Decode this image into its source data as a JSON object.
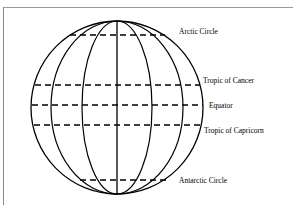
{
  "diagram": {
    "globe": {
      "cx": 117,
      "cy": 107.5,
      "rx": 86,
      "ry": 86.5
    },
    "meridians_rx": [
      0,
      35,
      66
    ],
    "latitude_lines": [
      {
        "name": "Arctic Circle",
        "y": 35,
        "x1": 70,
        "x2": 165,
        "label_x": 179,
        "label_y": 33.5
      },
      {
        "name": "Tropic of Cancer",
        "y": 85,
        "x1": 35,
        "x2": 200,
        "label_x": 203,
        "label_y": 82.5
      },
      {
        "name": "Equator",
        "y": 105,
        "x1": 32,
        "x2": 203,
        "label_x": 209,
        "label_y": 107.5
      },
      {
        "name": "Tropic of Capricorn",
        "y": 125,
        "x1": 34,
        "x2": 201,
        "label_x": 204,
        "label_y": 132.5
      },
      {
        "name": "Antarctic Circle",
        "y": 180,
        "x1": 80,
        "x2": 168,
        "label_x": 179,
        "label_y": 182.5
      }
    ],
    "labels": {
      "arctic": "Arctic Circle",
      "cancer": "Tropic of Cancer",
      "equator": "Equator",
      "capricorn": "Tropic of Capricorn",
      "antarctic": "Antarctic Circle"
    },
    "colors": {
      "line": "#000000",
      "frame": "#9a9a9a",
      "background": "#ffffff"
    }
  }
}
